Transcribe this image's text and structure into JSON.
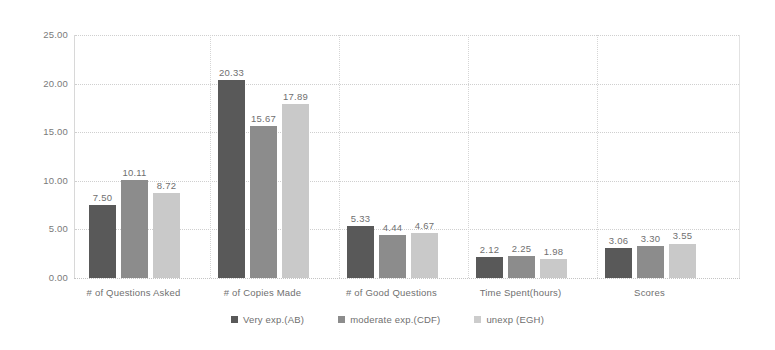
{
  "chart_data": {
    "type": "bar",
    "title": "",
    "subtitle": "",
    "xlabel": "",
    "ylabel": "",
    "ylim": [
      0,
      25
    ],
    "ytick_step": 5,
    "ytick_labels": [
      "0.00",
      "5.00",
      "10.00",
      "15.00",
      "20.00",
      "25.00"
    ],
    "grid": true,
    "legend_position": "bottom",
    "categories": [
      "# of Questions Asked",
      "# of Copies Made",
      "# of Good Questions",
      "Time Spent(hours)",
      "Scores"
    ],
    "series": [
      {
        "name": "Very exp.(AB)",
        "color": "#595959",
        "values": [
          7.5,
          20.33,
          5.33,
          2.12,
          3.06
        ],
        "labels": [
          "7.50",
          "20.33",
          "5.33",
          "2.12",
          "3.06"
        ]
      },
      {
        "name": "moderate exp.(CDF)",
        "color": "#8c8c8c",
        "values": [
          10.11,
          15.67,
          4.44,
          2.25,
          3.3
        ],
        "labels": [
          "10.11",
          "15.67",
          "4.44",
          "2.25",
          "3.30"
        ]
      },
      {
        "name": "unexp (EGH)",
        "color": "#c9c9c9",
        "values": [
          8.72,
          17.89,
          4.67,
          1.98,
          3.55
        ],
        "labels": [
          "8.72",
          "17.89",
          "4.67",
          "1.98",
          "3.55"
        ]
      }
    ]
  },
  "legend": {
    "items": [
      {
        "label": "Very exp.(AB)",
        "marker": "square-dark-swatch"
      },
      {
        "label": "moderate exp.(CDF)",
        "marker": "square-medium-swatch"
      },
      {
        "label": "unexp (EGH)",
        "marker": "square-light-swatch"
      }
    ]
  },
  "layout": {
    "plot": {
      "left": 74,
      "top": 35,
      "width": 666,
      "height": 243
    },
    "bar_width": 27,
    "bar_gap": 5,
    "group_starts": [
      14,
      143,
      272,
      401,
      530
    ],
    "group_span": 129
  }
}
